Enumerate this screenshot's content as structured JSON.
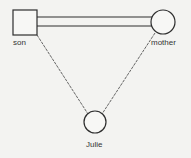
{
  "diagram": {
    "type": "genogram",
    "nodes": [
      {
        "id": "son",
        "label": "son",
        "shape": "square"
      },
      {
        "id": "mother",
        "label": "mother",
        "shape": "circle"
      },
      {
        "id": "julie",
        "label": "Julie",
        "shape": "circle"
      }
    ],
    "edges": [
      {
        "from": "son",
        "to": "mother",
        "style": "double-line"
      },
      {
        "from": "son",
        "to": "julie",
        "style": "thin-line"
      },
      {
        "from": "mother",
        "to": "julie",
        "style": "thin-line"
      }
    ]
  },
  "colors": {
    "background": "#f3f3f1",
    "stroke": "#2e2e2e",
    "thin_line": "#555555",
    "label": "#333333"
  }
}
